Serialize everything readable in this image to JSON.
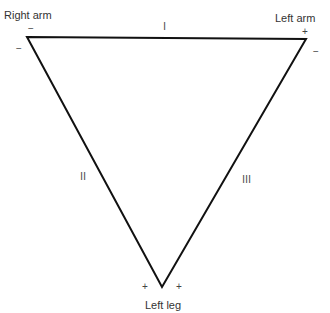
{
  "diagram": {
    "vertices": {
      "right_arm": {
        "label": "Right arm",
        "signs": [
          "−",
          "−"
        ]
      },
      "left_arm": {
        "label": "Left arm",
        "signs": [
          "+",
          "−"
        ]
      },
      "left_leg": {
        "label": "Left leg",
        "signs": [
          "+",
          "+"
        ]
      }
    },
    "leads": {
      "lead_1": "I",
      "lead_2": "II",
      "lead_3": "III"
    },
    "line_color": "#111111"
  }
}
